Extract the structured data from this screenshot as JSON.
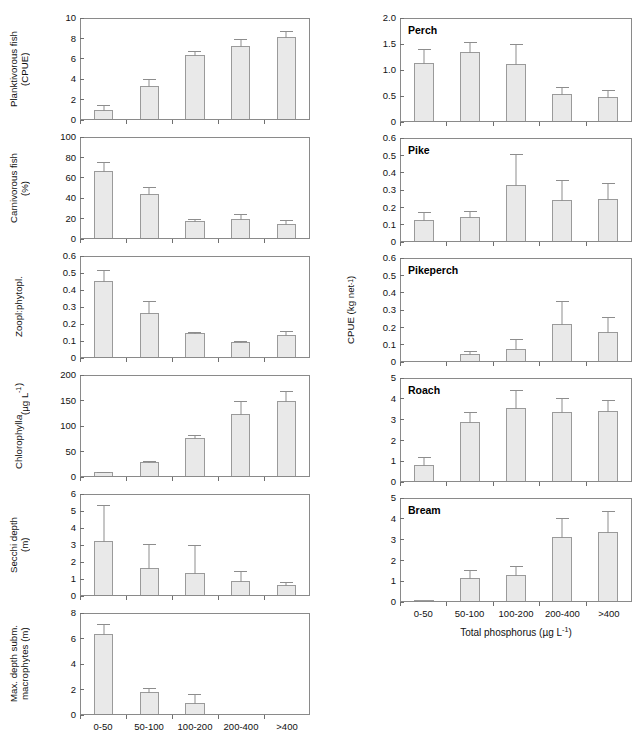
{
  "figure": {
    "xlabel": "Total phosphorus (µg L⁻¹)",
    "categories": [
      "0-50",
      "50-100",
      "100-200",
      "200-400",
      ">400"
    ]
  },
  "chart_data": [
    {
      "type": "bar",
      "panel_id": "planktivorous-fish",
      "title": "",
      "ylabel": "Planktivorous fish\n(CPUE)",
      "xlabel": "",
      "categories": [
        "0-50",
        "50-100",
        "100-200",
        "200-400",
        ">400"
      ],
      "values": [
        0.85,
        3.25,
        6.3,
        7.15,
        8.0
      ],
      "errors_upper": [
        0.6,
        0.75,
        0.5,
        0.75,
        0.75
      ],
      "ylim": [
        0,
        10
      ],
      "yticks": [
        0,
        2,
        4,
        6,
        8,
        10
      ],
      "grid": false
    },
    {
      "type": "bar",
      "panel_id": "carnivorous-fish",
      "title": "",
      "ylabel": "Carnivorous fish\n(%)",
      "xlabel": "",
      "categories": [
        "0-50",
        "50-100",
        "100-200",
        "200-400",
        ">400"
      ],
      "values": [
        65.5,
        43.0,
        17.0,
        19.0,
        14.0
      ],
      "errors_upper": [
        10.0,
        8.0,
        2.5,
        6.0,
        5.0
      ],
      "ylim": [
        0,
        100
      ],
      "yticks": [
        0,
        20,
        40,
        60,
        80,
        100
      ],
      "grid": false
    },
    {
      "type": "bar",
      "panel_id": "zoopl-phytopl",
      "title": "",
      "ylabel": "Zoopl:phytopl.",
      "xlabel": "",
      "categories": [
        "0-50",
        "50-100",
        "100-200",
        "200-400",
        ">400"
      ],
      "values": [
        0.45,
        0.26,
        0.14,
        0.09,
        0.13
      ],
      "errors_upper": [
        0.065,
        0.075,
        0.012,
        0.008,
        0.03
      ],
      "ylim": [
        0,
        0.6
      ],
      "yticks": [
        0,
        0.1,
        0.2,
        0.3,
        0.4,
        0.5,
        0.6
      ],
      "ytick_labels": [
        "0",
        "0.1",
        "0.2",
        "0.3",
        "0.4",
        "0.5",
        "0.6"
      ],
      "grid": false
    },
    {
      "type": "bar",
      "panel_id": "chlorophyll-a",
      "title": "",
      "ylabel": "Chlorophyll a\n(µg L⁻¹)",
      "xlabel": "",
      "categories": [
        "0-50",
        "50-100",
        "100-200",
        "200-400",
        ">400"
      ],
      "values": [
        7.0,
        27.0,
        74.0,
        122.0,
        147.0
      ],
      "errors_upper": [
        3.0,
        4.0,
        8.0,
        27.0,
        22.0
      ],
      "ylim": [
        0,
        200
      ],
      "yticks": [
        0,
        50,
        100,
        150,
        200
      ],
      "grid": false
    },
    {
      "type": "bar",
      "panel_id": "secchi-depth",
      "title": "",
      "ylabel": "Secchi depth\n(m)",
      "xlabel": "",
      "categories": [
        "0-50",
        "50-100",
        "100-200",
        "200-400",
        ">400"
      ],
      "values": [
        3.2,
        1.6,
        1.3,
        0.85,
        0.58
      ],
      "errors_upper": [
        2.15,
        1.45,
        1.7,
        0.65,
        0.27
      ],
      "ylim": [
        0,
        6
      ],
      "yticks": [
        0,
        1,
        2,
        3,
        4,
        5,
        6
      ],
      "grid": false
    },
    {
      "type": "bar",
      "panel_id": "max-depth-subm-macrophytes",
      "title": "",
      "ylabel": "Max. depth subm.\nmacrophytes (m)",
      "xlabel": "Total phosphorus (µg L⁻¹)",
      "categories": [
        "0-50",
        "50-100",
        "100-200",
        "200-400",
        ">400"
      ],
      "values": [
        6.3,
        1.7,
        0.85,
        0,
        0
      ],
      "errors_upper": [
        0.85,
        0.4,
        0.8,
        0,
        0
      ],
      "ylim": [
        0,
        8
      ],
      "yticks": [
        0,
        2,
        4,
        6,
        8
      ],
      "grid": false
    },
    {
      "type": "bar",
      "panel_id": "perch",
      "title": "Perch",
      "ylabel": "",
      "xlabel": "",
      "categories": [
        "0-50",
        "50-100",
        "100-200",
        "200-400",
        ">400"
      ],
      "values": [
        1.12,
        1.33,
        1.1,
        0.52,
        0.47
      ],
      "errors_upper": [
        0.28,
        0.21,
        0.41,
        0.15,
        0.14
      ],
      "ylim": [
        0,
        2.0
      ],
      "yticks": [
        0,
        0.5,
        1.0,
        1.5,
        2.0
      ],
      "ytick_labels": [
        "0",
        "0.5",
        "1.0",
        "1.5",
        "2.0"
      ],
      "grid": false
    },
    {
      "type": "bar",
      "panel_id": "pike",
      "title": "Pike",
      "ylabel": "",
      "xlabel": "",
      "categories": [
        "0-50",
        "50-100",
        "100-200",
        "200-400",
        ">400"
      ],
      "values": [
        0.12,
        0.14,
        0.325,
        0.235,
        0.245
      ],
      "errors_upper": [
        0.055,
        0.04,
        0.185,
        0.12,
        0.095
      ],
      "ylim": [
        0,
        0.6
      ],
      "yticks": [
        0,
        0.1,
        0.2,
        0.3,
        0.4,
        0.5,
        0.6
      ],
      "ytick_labels": [
        "0",
        "0.1",
        "0.2",
        "0.3",
        "0.4",
        "0.5",
        "0.6"
      ],
      "grid": false
    },
    {
      "type": "bar",
      "panel_id": "pikeperch",
      "title": "Pikeperch",
      "ylabel": "CPUE (kg net⁻¹)",
      "xlabel": "",
      "categories": [
        "0-50",
        "50-100",
        "100-200",
        "200-400",
        ">400"
      ],
      "values": [
        0,
        0.043,
        0.07,
        0.215,
        0.165
      ],
      "errors_upper": [
        0,
        0.02,
        0.065,
        0.135,
        0.095
      ],
      "ylim": [
        0,
        0.6
      ],
      "yticks": [
        0,
        0.1,
        0.2,
        0.3,
        0.4,
        0.5,
        0.6
      ],
      "ytick_labels": [
        "0",
        "0.1",
        "0.2",
        "0.3",
        "0.4",
        "0.5",
        "0.6"
      ],
      "grid": false
    },
    {
      "type": "bar",
      "panel_id": "roach",
      "title": "Roach",
      "ylabel": "",
      "xlabel": "",
      "categories": [
        "0-50",
        "50-100",
        "100-200",
        "200-400",
        ">400"
      ],
      "values": [
        0.78,
        2.85,
        3.5,
        3.32,
        3.35
      ],
      "errors_upper": [
        0.42,
        0.5,
        0.9,
        0.7,
        0.6
      ],
      "ylim": [
        0,
        5
      ],
      "yticks": [
        0,
        1,
        2,
        3,
        4,
        5
      ],
      "grid": false
    },
    {
      "type": "bar",
      "panel_id": "bream",
      "title": "Bream",
      "ylabel": "",
      "xlabel": "Total phosphorus (µg L⁻¹)",
      "categories": [
        "0-50",
        "50-100",
        "100-200",
        "200-400",
        ">400"
      ],
      "values": [
        0.05,
        1.1,
        1.25,
        3.08,
        3.32
      ],
      "errors_upper": [
        0.02,
        0.42,
        0.48,
        0.95,
        1.08
      ],
      "ylim": [
        0,
        5
      ],
      "yticks": [
        0,
        1,
        2,
        3,
        4,
        5
      ],
      "grid": false
    }
  ]
}
